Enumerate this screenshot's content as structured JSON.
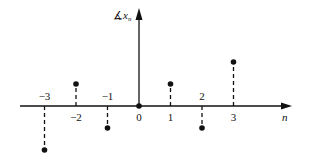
{
  "chart_data": {
    "type": "stem",
    "title": "",
    "xlabel": "n",
    "ylabel": "x_n",
    "ylabel_prefix": "∡",
    "x": [
      -3,
      -2,
      -1,
      0,
      1,
      2,
      3
    ],
    "values": [
      -2,
      1,
      -1,
      0,
      1,
      -1,
      2
    ],
    "tick_labels": [
      "−3",
      "−2",
      "−1",
      "0",
      "1",
      "2",
      "3"
    ],
    "stem_style": "dashed",
    "marker": "filled-circle",
    "grid": false,
    "legend": null,
    "xlim": [
      -3.9,
      4.3
    ],
    "ylim": [
      -2.2,
      4.5
    ]
  },
  "labels": {
    "y_axis_symbol": "∡",
    "y_axis_var": "x",
    "y_axis_sub": "n",
    "x_axis": "n"
  },
  "colors": {
    "ink": "#111111",
    "background": "#ffffff"
  }
}
